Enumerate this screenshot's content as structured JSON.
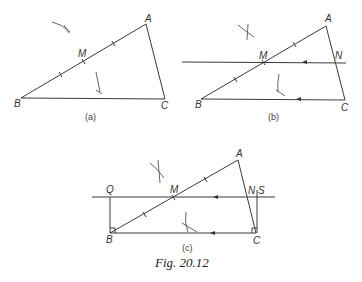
{
  "figure": {
    "caption": "Fig. 20.12",
    "panels": [
      {
        "id": "a",
        "label": "(a)",
        "points": {
          "A": "A",
          "B": "B",
          "C": "C",
          "M": "M"
        }
      },
      {
        "id": "b",
        "label": "(b)",
        "points": {
          "A": "A",
          "B": "B",
          "C": "C",
          "M": "M",
          "N": "N"
        }
      },
      {
        "id": "c",
        "label": "(c)",
        "points": {
          "A": "A",
          "B": "B",
          "C": "C",
          "M": "M",
          "N": "N",
          "Q": "Q",
          "S": "S"
        }
      }
    ]
  }
}
